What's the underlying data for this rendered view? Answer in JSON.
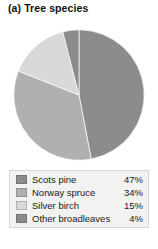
{
  "panel": {
    "label": "(a)",
    "title": "Tree species",
    "full_title": "(a)  Tree species"
  },
  "legend": {
    "rows": [
      {
        "label": "Scots pine",
        "value": "47%",
        "color": "#8c8c8c"
      },
      {
        "label": "Norway spruce",
        "value": "34%",
        "color": "#b0b0b0"
      },
      {
        "label": "Silver birch",
        "value": "15%",
        "color": "#d8d8d8"
      },
      {
        "label": "Other broadleaves",
        "value": "4%",
        "color": "#8c8c8c"
      }
    ]
  },
  "chart_data": {
    "type": "pie",
    "title": "(a)  Tree species",
    "subtitle": "",
    "xlabel": "",
    "ylabel": "",
    "grid": false,
    "legend_position": "bottom",
    "units": "percent",
    "start_angle_deg": 0,
    "direction": "clockwise",
    "categories": [
      "Scots pine",
      "Norway spruce",
      "Silver birch",
      "Other broadleaves"
    ],
    "values": [
      47,
      34,
      15,
      4
    ],
    "labels": [
      "47%",
      "34%",
      "15%",
      "4%"
    ],
    "colors": [
      "#8c8c8c",
      "#b0b0b0",
      "#d8d8d8",
      "#8c8c8c"
    ],
    "slices": [
      {
        "name": "Scots pine",
        "value": 47,
        "label": "47%",
        "color": "#8c8c8c"
      },
      {
        "name": "Norway spruce",
        "value": 34,
        "label": "34%",
        "color": "#b0b0b0"
      },
      {
        "name": "Silver birch",
        "value": 15,
        "label": "15%",
        "color": "#d8d8d8"
      },
      {
        "name": "Other broadleaves",
        "value": 4,
        "label": "4%",
        "color": "#8c8c8c"
      }
    ]
  }
}
